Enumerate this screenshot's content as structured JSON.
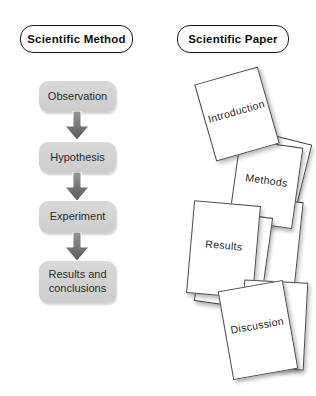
{
  "left_panel": {
    "title": "Scientific Method",
    "steps": [
      {
        "label": "Observation"
      },
      {
        "label": "Hypothesis"
      },
      {
        "label": "Experiment"
      },
      {
        "label": "Results and conclusions"
      }
    ],
    "arrow_icon": "down-block-arrow"
  },
  "right_panel": {
    "title": "Scientific Paper",
    "pages": [
      {
        "label": "Introduction"
      },
      {
        "label": "Methods"
      },
      {
        "label": "Results"
      },
      {
        "label": "Discussion"
      }
    ]
  },
  "colors": {
    "background": "#ffffff",
    "flow_box_fill": "#d2d2d2",
    "arrow_gray_top": "#969696",
    "arrow_gray_bottom": "#5a5a5a",
    "label_border": "#1a1a1a",
    "page_border": "#4a4a4a",
    "text": "#2b2b2b"
  }
}
